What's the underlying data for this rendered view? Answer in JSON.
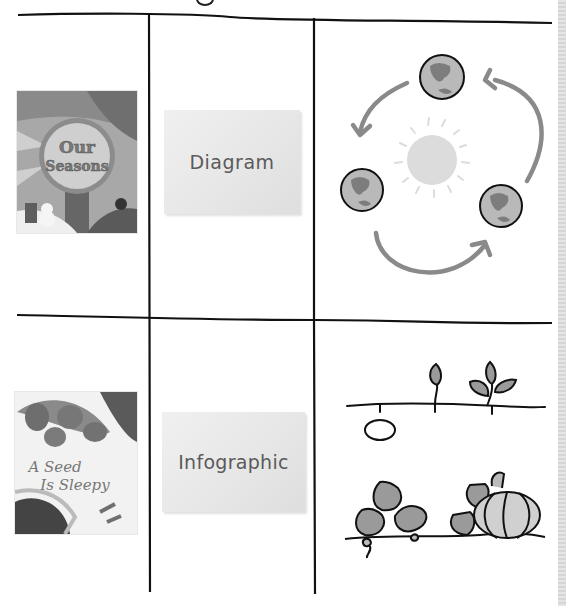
{
  "page": {
    "title_fragment": "",
    "background": "#ffffff",
    "line_color": "#111111"
  },
  "rows": [
    {
      "book": {
        "title": "Our Seasons",
        "title_line1": "Our",
        "title_line2": "Seasons"
      },
      "card": {
        "label": "Diagram"
      },
      "illustration": {
        "name": "earth-orbit-around-sun",
        "elements": [
          "sun",
          "earth-top",
          "earth-left",
          "earth-right",
          "arrow-top-to-left",
          "arrow-left-to-right",
          "arrow-right-to-top"
        ]
      }
    },
    {
      "book": {
        "title": "A Seed Is Sleepy",
        "title_line1": "A Seed",
        "title_line2": "Is Sleepy"
      },
      "card": {
        "label": "Infographic"
      },
      "illustration": {
        "name": "seed-growth-stages",
        "elements": [
          "seed",
          "sprout",
          "seedling",
          "pumpkin-vine-leaves",
          "pumpkin"
        ]
      }
    }
  ],
  "colors": {
    "earth_fill": "#b9b9b9",
    "earth_land": "#7d7d7d",
    "arrow": "#8a8a8a",
    "sun": "#dcdcdc",
    "leaf": "#9a9a9a",
    "pumpkin": "#d0d0d0",
    "card_text": "#5a5a5a"
  }
}
